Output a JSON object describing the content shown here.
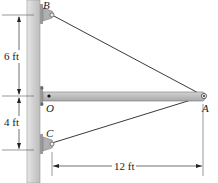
{
  "diagram": {
    "type": "boom-cable structure",
    "points": {
      "B": "B",
      "O": "O",
      "C": "C",
      "A": "A"
    },
    "dimensions": {
      "B_to_O": "6 ft",
      "O_to_C": "4 ft",
      "wall_to_A": "12 ft"
    },
    "members": [
      {
        "name": "cable-BA",
        "from": "B",
        "to": "A"
      },
      {
        "name": "cable-CA",
        "from": "C",
        "to": "A"
      },
      {
        "name": "boom-OA",
        "from": "O",
        "to": "A"
      }
    ],
    "colors": {
      "wall": "#cfcfcf",
      "boom": "#b9b9b9",
      "bracket": "#a8a8a8",
      "line": "#222222"
    }
  }
}
